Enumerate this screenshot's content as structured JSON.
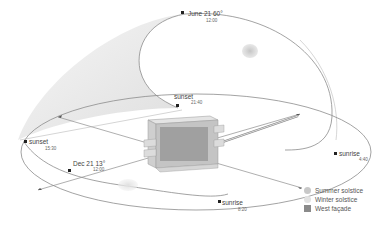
{
  "diagram": {
    "summer_path": {
      "label": "June 21 60°",
      "time": "12:00",
      "sunset_label": "sunset",
      "sunset_time": "21:40",
      "sunrise_label": "sunrise",
      "sunrise_time": "4:40"
    },
    "winter_path": {
      "label": "Dec 21 13°",
      "time": "12:00",
      "sunset_label": "sunset",
      "sunset_time": "15:30",
      "sunrise_label": "sunrise",
      "sunrise_time": "8:20"
    },
    "compass_marks": [
      "N",
      "E",
      "S",
      "W"
    ],
    "legend": [
      {
        "label": "Summer solstice",
        "color": "#c8c8c8",
        "shape": "circle"
      },
      {
        "label": "Winter solstice",
        "color": "#e2e2e2",
        "shape": "circle"
      },
      {
        "label": "West façade",
        "color": "#8a8a8a",
        "shape": "square"
      }
    ],
    "colors": {
      "line": "#8c8c8c",
      "shadow_fill": "#ececec",
      "building_light": "#dcdcdc",
      "building_mid": "#bdbdbd",
      "building_dark": "#9a9a9a"
    }
  }
}
